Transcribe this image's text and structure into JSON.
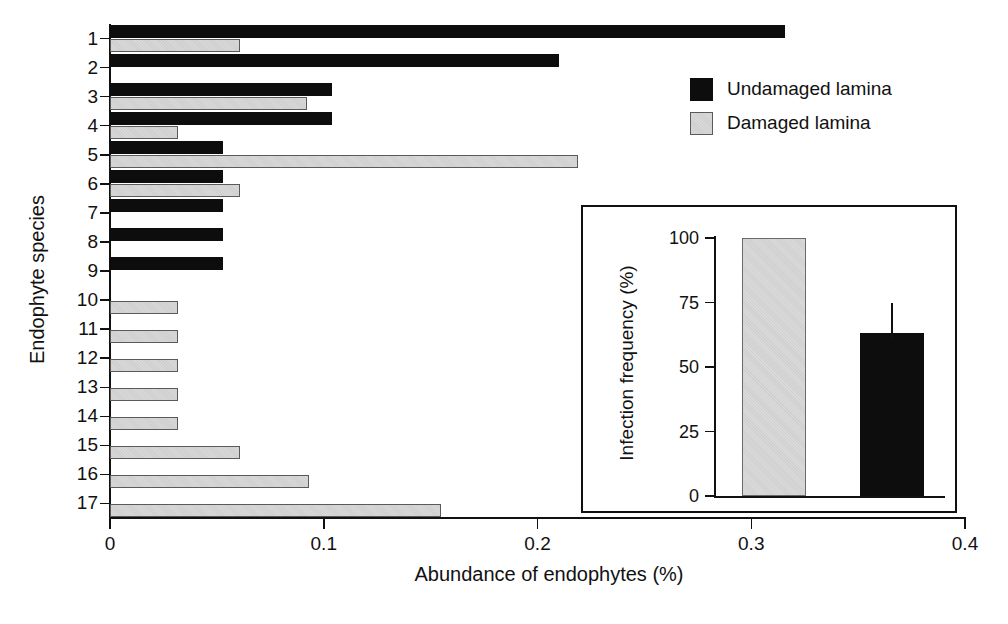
{
  "chart_data": [
    {
      "id": "main",
      "type": "bar",
      "orientation": "horizontal",
      "title": "",
      "xlabel": "Abundance of endophytes (%)",
      "ylabel": "Endophyte species",
      "xlim": [
        0,
        0.4
      ],
      "xticks": [
        "0",
        "0.1",
        "0.2",
        "0.3",
        "0.4"
      ],
      "xtick_values": [
        0,
        0.1,
        0.2,
        0.3,
        0.4
      ],
      "grid": false,
      "legend_position": "top-right",
      "categories": [
        "1",
        "2",
        "3",
        "4",
        "5",
        "6",
        "7",
        "8",
        "9",
        "10",
        "11",
        "12",
        "13",
        "14",
        "15",
        "16",
        "17"
      ],
      "series": [
        {
          "name": "Undamaged lamina",
          "color": "#0d0d0d",
          "values": [
            0.316,
            0.21,
            0.104,
            0.104,
            0.053,
            0.053,
            0.053,
            0.053,
            0.053,
            0,
            0,
            0,
            0,
            0,
            0,
            0,
            0
          ]
        },
        {
          "name": "Damaged lamina",
          "color": "#d4d4d4",
          "values": [
            0.061,
            0,
            0.092,
            0.032,
            0.219,
            0.061,
            0,
            0,
            0,
            0.032,
            0.032,
            0.032,
            0.032,
            0.032,
            0.061,
            0.093,
            0.155
          ]
        }
      ]
    },
    {
      "id": "inset",
      "type": "bar",
      "orientation": "vertical",
      "title": "",
      "xlabel": "",
      "ylabel": "Infection frequency (%)",
      "ylim": [
        0,
        100
      ],
      "yticks": [
        "0",
        "25",
        "50",
        "75",
        "100"
      ],
      "ytick_values": [
        0,
        25,
        50,
        75,
        100
      ],
      "grid": false,
      "categories": [
        "Damaged lamina",
        "Undamaged lamina"
      ],
      "values": [
        100,
        63
      ],
      "errors": [
        0,
        12
      ],
      "colors": [
        "#d4d4d4",
        "#0d0d0d"
      ]
    }
  ],
  "main": {
    "xlabel": "Abundance of endophytes (%)",
    "ylabel": "Endophyte species",
    "xticks": [
      "0",
      "0.1",
      "0.2",
      "0.3",
      "0.4"
    ],
    "yticks": [
      "1",
      "2",
      "3",
      "4",
      "5",
      "6",
      "7",
      "8",
      "9",
      "10",
      "11",
      "12",
      "13",
      "14",
      "15",
      "16",
      "17"
    ]
  },
  "legend": {
    "items": [
      {
        "label": "Undamaged lamina",
        "swatch": "black-square-swatch"
      },
      {
        "label": "Damaged lamina",
        "swatch": "gray-square-swatch"
      }
    ]
  },
  "inset": {
    "ylabel": "Infection frequency (%)",
    "yticks": [
      "0",
      "25",
      "50",
      "75",
      "100"
    ]
  },
  "colors": {
    "undamaged": "#0d0d0d",
    "damaged": "#d4d4d4",
    "axis": "#111111",
    "background": "#ffffff"
  }
}
